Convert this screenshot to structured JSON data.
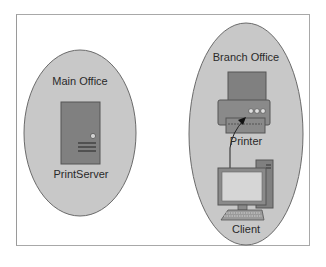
{
  "diagram": {
    "type": "network-topology",
    "colors": {
      "zone_fill": "#c8c8c8",
      "zone_stroke": "#666666",
      "device_fill": "#808080",
      "device_stroke": "#555555",
      "screen_fill": "#d6d6d6",
      "frame_border": "#a8a8a8",
      "text": "#2a2a2a"
    },
    "zones": [
      {
        "id": "main-office",
        "label": "Main Office"
      },
      {
        "id": "branch-office",
        "label": "Branch Office"
      }
    ],
    "nodes": [
      {
        "id": "printserver",
        "label": "PrintServer",
        "zone": "main-office",
        "icon": "server-tower-icon"
      },
      {
        "id": "printer",
        "label": "Printer",
        "zone": "branch-office",
        "icon": "printer-icon"
      },
      {
        "id": "client",
        "label": "Client",
        "zone": "branch-office",
        "icon": "desktop-computer-icon"
      }
    ],
    "edges": [
      {
        "from": "client",
        "to": "printer",
        "style": "arrow"
      }
    ]
  }
}
